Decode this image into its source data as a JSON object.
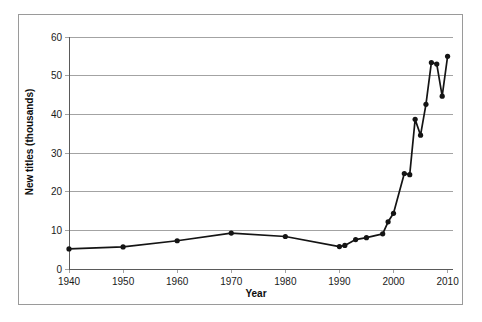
{
  "chart_data": {
    "type": "line",
    "title": "",
    "xlabel": "Year",
    "ylabel": "New titles (thousands)",
    "xlim": [
      1940,
      2011
    ],
    "ylim": [
      0,
      60
    ],
    "xticks": [
      1940,
      1950,
      1960,
      1970,
      1980,
      1990,
      2000,
      2010
    ],
    "yticks": [
      0,
      10,
      20,
      30,
      40,
      50,
      60
    ],
    "xtick_labels": [
      "1940",
      "1950",
      "1960",
      "1970",
      "1980",
      "1990",
      "2000",
      "2010"
    ],
    "ytick_labels": [
      "0",
      "10",
      "20",
      "30",
      "40",
      "50",
      "60"
    ],
    "grid": "horizontal",
    "legend": "none",
    "marker": "filled-circle",
    "line_color": "#141414",
    "marker_color": "#141414",
    "grid_color": "#8c8c8c",
    "background_color": "#ffffff",
    "series": [
      {
        "name": "New titles",
        "x": [
          1940,
          1950,
          1960,
          1970,
          1980,
          1990,
          1991,
          1993,
          1995,
          1998,
          1999,
          2000,
          2002,
          2003,
          2004,
          2005,
          2006,
          2007,
          2008,
          2009,
          2010
        ],
        "values": [
          5.2,
          5.7,
          7.3,
          9.3,
          8.4,
          5.8,
          6.1,
          7.6,
          8.1,
          9.1,
          12.2,
          14.4,
          24.7,
          24.4,
          38.7,
          34.6,
          42.6,
          53.4,
          53.0,
          44.7,
          55.0
        ]
      }
    ],
    "axis_titles": {
      "x": "Year",
      "y": "New titles (thousands)"
    }
  }
}
